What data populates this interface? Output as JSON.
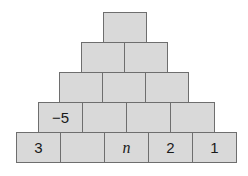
{
  "pyramid": {
    "colors": {
      "block_fill": "#d9d9d9",
      "block_border": "#6e6e6e",
      "text": "#1a1a1a"
    },
    "rows": [
      {
        "cells": [
          ""
        ]
      },
      {
        "cells": [
          "",
          ""
        ]
      },
      {
        "cells": [
          "",
          "",
          ""
        ]
      },
      {
        "cells": [
          "−5",
          "",
          "",
          ""
        ]
      },
      {
        "cells": [
          "3",
          "",
          "n",
          "2",
          "1"
        ]
      }
    ]
  }
}
